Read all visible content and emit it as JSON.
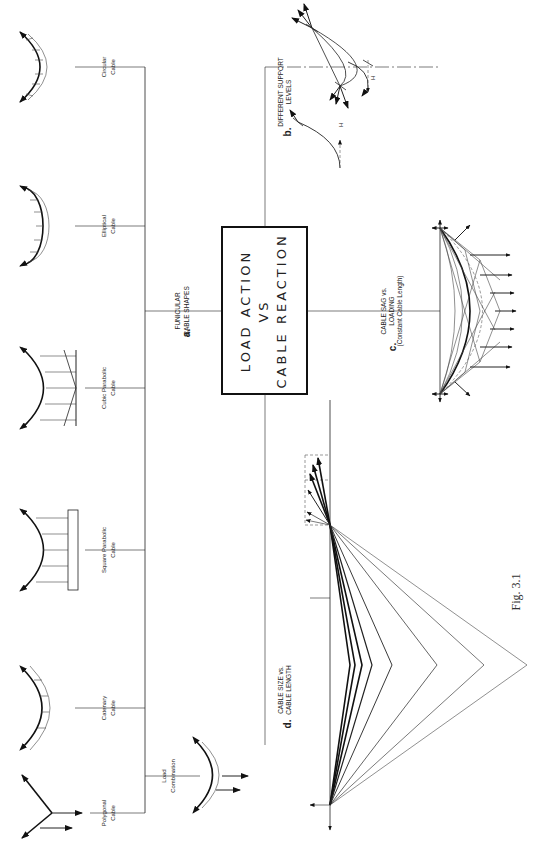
{
  "figure": {
    "caption": "Fig. 3.1",
    "orientation": "rotated 90° counter-clockwise",
    "center_box": {
      "line1": "LOAD ACTION",
      "line2": "VS",
      "line3": "CABLE REACTION"
    },
    "sections": {
      "a": {
        "letter": "a.",
        "line1": "FUNICULAR",
        "line2": "CABLE SHAPES",
        "items": [
          {
            "line1": "Circular",
            "line2": "Cable"
          },
          {
            "line1": "Elliptical",
            "line2": "Cable"
          },
          {
            "line1": "Cubic Parabolic",
            "line2": "Cable"
          },
          {
            "line1": "Square Parabolic",
            "line2": "Cable"
          },
          {
            "line1": "Catenary",
            "line2": "Cable"
          },
          {
            "line1": "Polygonal",
            "line2": "Cable"
          }
        ],
        "extra": {
          "line1": "Load",
          "line2": "Combination"
        }
      },
      "b": {
        "letter": "b.",
        "line1": "DIFFERENT SUPPORT",
        "line2": "LEVELS",
        "force_label_1": "H",
        "force_label_2": "H"
      },
      "c": {
        "letter": "c.",
        "line1": "CABLE SAG vs.",
        "line2": "LOADING",
        "line3": "(Constant Cable Length)"
      },
      "d": {
        "letter": "d.",
        "line1": "CABLE SIZE vs.",
        "line2": "CABLE LENGTH"
      }
    }
  }
}
